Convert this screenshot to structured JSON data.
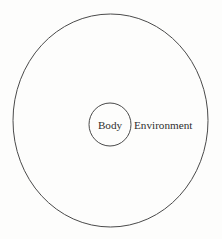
{
  "figure": {
    "type": "nested-circles-venn",
    "background_color": "#fdfdfc",
    "stroke_color": "#4a4a4a",
    "text_color": "#2e2e2e",
    "outer": {
      "label": "Environment",
      "cx": 110.5,
      "cy": 120.5,
      "rx": 97.5,
      "ry": 106.5,
      "stroke_width": 1.0
    },
    "inner": {
      "label": "Body",
      "cx": 110,
      "cy": 124.5,
      "rx": 21,
      "ry": 21.5,
      "stroke_width": 1.0
    },
    "labels": {
      "body": {
        "text": "Body",
        "x": 110,
        "y": 128.5,
        "font_size": 11.2
      },
      "environment": {
        "text": "Environment",
        "x": 134,
        "y": 128.5,
        "font_size": 11.2
      }
    }
  }
}
